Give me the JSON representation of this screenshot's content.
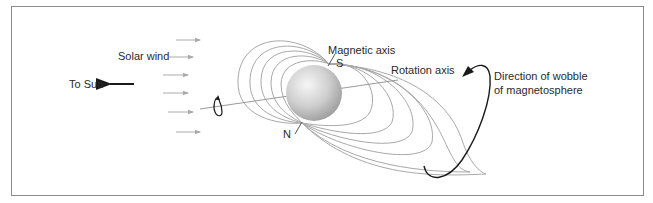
{
  "diagram": {
    "labels": {
      "to_sun": "To Sun",
      "solar_wind": "Solar wind",
      "magnetic_axis": "Magnetic axis",
      "south_pole": "S",
      "north_pole": "N",
      "rotation_axis": "Rotation axis",
      "wobble_line1": "Direction of wobble",
      "wobble_line2": "of magnetosphere"
    },
    "icons": {
      "to_sun_arrow": "left-arrow-icon",
      "solar_wind_arrows": "right-arrow-icon",
      "rotation_arrow": "circular-arrow-icon",
      "wobble_arrow": "curved-arrow-icon"
    },
    "colors": {
      "frame": "#8a8a8a",
      "field_lines": "#a8a8a8",
      "solar_wind_arrows": "#aaaaaa",
      "dark_arrows": "#1a1a1a",
      "planet_highlight": "#f4f4f4",
      "planet_shadow": "#a0a0a0",
      "text": "#2a2a2a"
    },
    "solar_wind_arrow_count": 6
  }
}
